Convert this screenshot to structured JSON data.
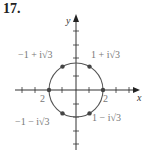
{
  "problem_number": "17.",
  "axes": {
    "x_label": "x",
    "y_label": "y"
  },
  "circle": {
    "center": [
      0,
      0
    ],
    "radius": 2
  },
  "points": [
    {
      "label": "1 + i√3",
      "re": 1,
      "im": 1.732
    },
    {
      "label": "−1 + i√3",
      "re": -1,
      "im": 1.732
    },
    {
      "label": "−1 − i√3",
      "re": -1,
      "im": -1.732
    },
    {
      "label": "1 − i√3",
      "re": 1,
      "im": -1.732
    },
    {
      "label": "",
      "re": 2,
      "im": 0
    },
    {
      "label": "",
      "re": -2,
      "im": 0
    }
  ],
  "tick_labels": {
    "neg_two": "2",
    "pos_two": "2"
  },
  "colors": {
    "axis": "#333333",
    "circle": "#555555",
    "point": "#444444"
  }
}
